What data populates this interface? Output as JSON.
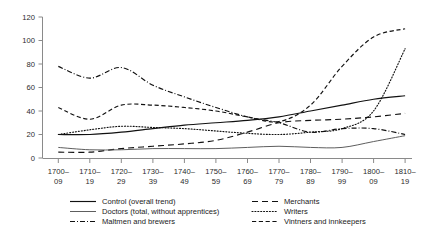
{
  "chart_data": {
    "type": "line",
    "title": "",
    "subtitle": "",
    "xlabel": "",
    "ylabel": "",
    "grid": false,
    "legend_position": "bottom",
    "ylim": [
      0,
      120
    ],
    "yticks": [
      0,
      20,
      40,
      60,
      80,
      100,
      120
    ],
    "categories": [
      "1700–09",
      "1710–19",
      "1720–29",
      "1730–39",
      "1740–49",
      "1750–59",
      "1760–69",
      "1770–79",
      "1780–89",
      "1790–99",
      "1800–09",
      "1810–19"
    ],
    "series": [
      {
        "name": "Control (overall trend)",
        "style": "solid",
        "values": [
          20,
          20,
          22,
          25,
          28,
          30,
          32,
          35,
          40,
          45,
          50,
          53
        ]
      },
      {
        "name": "Doctors (total, without apprentices)",
        "style": "solid-light",
        "values": [
          9,
          7,
          7,
          8,
          8,
          8,
          9,
          10,
          9,
          9,
          14,
          19
        ]
      },
      {
        "name": "Maltmen and brewers",
        "style": "dash-dot-dot",
        "values": [
          78,
          68,
          77,
          62,
          52,
          43,
          35,
          30,
          22,
          25,
          25,
          20
        ]
      },
      {
        "name": "Merchants",
        "style": "long-dash",
        "values": [
          5,
          5,
          8,
          10,
          12,
          15,
          22,
          30,
          32,
          33,
          35,
          38
        ]
      },
      {
        "name": "Writers",
        "style": "dotted",
        "values": [
          20,
          24,
          27,
          26,
          25,
          23,
          21,
          20,
          22,
          25,
          40,
          93
        ]
      },
      {
        "name": "Vintners and innkeepers",
        "style": "medium-dash",
        "values": [
          43,
          33,
          45,
          45,
          43,
          40,
          35,
          31,
          45,
          78,
          103,
          110
        ]
      }
    ]
  },
  "legend": {
    "column_left": [
      {
        "label": "Control (overall trend)",
        "swatch": "solid-line-icon"
      },
      {
        "label": "Doctors (total, without apprentices)",
        "swatch": "solid-light-line-icon"
      },
      {
        "label": "Maltmen and brewers",
        "swatch": "dash-dot-dot-line-icon"
      }
    ],
    "column_right": [
      {
        "label": "Merchants",
        "swatch": "long-dash-line-icon"
      },
      {
        "label": "Writers",
        "swatch": "dotted-line-icon"
      },
      {
        "label": "Vintners and innkeepers",
        "swatch": "medium-dash-line-icon"
      }
    ]
  },
  "colors": {
    "series": "#111111",
    "doctors": "#555555",
    "axis": "#8a8a8a",
    "text": "#1a1a1a",
    "background": "#ffffff"
  }
}
